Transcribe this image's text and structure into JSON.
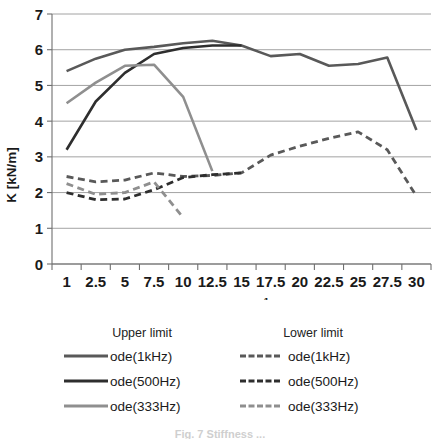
{
  "chart_data": {
    "type": "line",
    "title": "",
    "xlabel": "B [N/ms-1]",
    "ylabel": "K [kN/m]",
    "x": [
      1,
      2.5,
      5,
      7.5,
      10,
      12.5,
      15,
      17.5,
      20,
      22.5,
      25,
      27.5,
      30
    ],
    "categories": [
      "1",
      "2.5",
      "5",
      "7.5",
      "10",
      "12.5",
      "15",
      "17.5",
      "20",
      "22.5",
      "25",
      "27.5",
      "30"
    ],
    "ylim": [
      0,
      7
    ],
    "yticks": [
      "0",
      "1",
      "2",
      "3",
      "4",
      "5",
      "6",
      "7"
    ],
    "grid": true,
    "legend_position": "below",
    "series": [
      {
        "name": "ode(1kHz)",
        "group": "Upper limit",
        "style": "solid",
        "color": "#595959",
        "values": [
          5.4,
          5.75,
          6.0,
          6.08,
          6.18,
          6.25,
          6.12,
          5.82,
          5.88,
          5.55,
          5.6,
          5.78,
          3.75
        ]
      },
      {
        "name": "ode(500Hz)",
        "group": "Upper limit",
        "style": "solid",
        "color": "#2e2e2e",
        "values": [
          3.2,
          4.55,
          5.35,
          5.88,
          6.05,
          6.12,
          6.12,
          null,
          null,
          null,
          null,
          null,
          null
        ]
      },
      {
        "name": "ode(333Hz)",
        "group": "Upper limit",
        "style": "solid",
        "color": "#8f8f8f",
        "values": [
          4.5,
          5.08,
          5.55,
          5.58,
          4.68,
          2.6,
          null,
          null,
          null,
          null,
          null,
          null,
          null
        ]
      },
      {
        "name": "ode(1kHz)",
        "group": "Lower limit",
        "style": "dashed",
        "color": "#595959",
        "values": [
          2.45,
          2.3,
          2.35,
          2.55,
          2.45,
          2.48,
          2.55,
          3.05,
          3.3,
          3.52,
          3.7,
          3.2,
          1.9
        ]
      },
      {
        "name": "ode(500Hz)",
        "group": "Lower limit",
        "style": "dashed",
        "color": "#2e2e2e",
        "values": [
          2.0,
          1.8,
          1.82,
          2.08,
          2.42,
          2.5,
          2.55,
          null,
          null,
          null,
          null,
          null,
          null
        ]
      },
      {
        "name": "ode(333Hz)",
        "group": "Lower limit",
        "style": "dashed",
        "color": "#8f8f8f",
        "values": [
          2.25,
          1.95,
          2.0,
          2.3,
          1.3,
          null,
          null,
          null,
          null,
          null,
          null,
          null,
          null
        ]
      }
    ]
  },
  "legend": {
    "upper_heading": "Upper limit",
    "lower_heading": "Lower limit",
    "upper_items": [
      {
        "label": "ode(1kHz)",
        "color": "#595959"
      },
      {
        "label": "ode(500Hz)",
        "color": "#2e2e2e"
      },
      {
        "label": "ode(333Hz)",
        "color": "#8f8f8f"
      }
    ],
    "lower_items": [
      {
        "label": "ode(1kHz)",
        "color": "#595959"
      },
      {
        "label": "ode(500Hz)",
        "color": "#2e2e2e"
      },
      {
        "label": "ode(333Hz)",
        "color": "#8f8f8f"
      }
    ]
  },
  "caption": {
    "text": "Fig. 7   Stiffness ..."
  }
}
